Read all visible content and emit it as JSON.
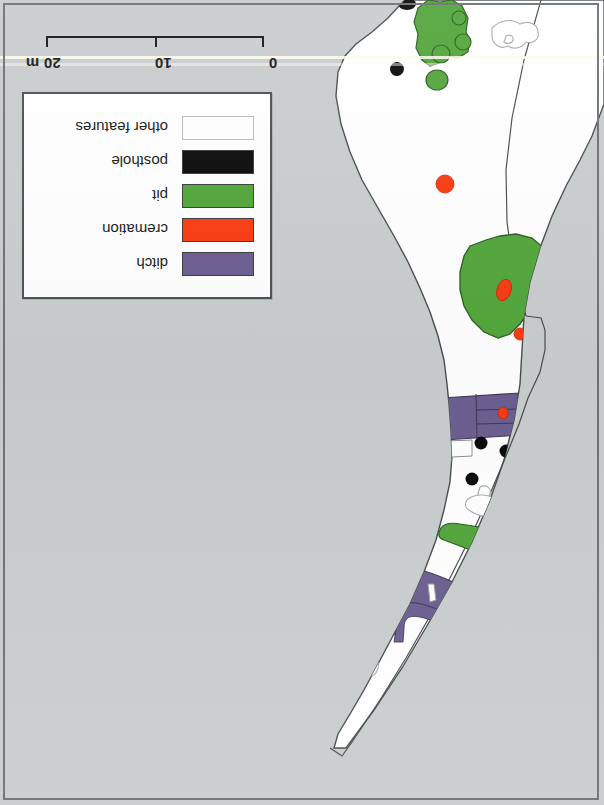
{
  "figure": {
    "kind": "archaeological-excavation-plan",
    "orientation": "rotated-180",
    "background_color": "#c9cdce",
    "trench_fill": "#ffffff",
    "outline_color": "#4a4d4f"
  },
  "scalebar": {
    "labels": [
      "0",
      "10",
      "20"
    ],
    "unit": "m",
    "label_0": "0",
    "label_10": "10",
    "label_20": "20",
    "unit_label": "m",
    "max_value": 20
  },
  "legend": {
    "items": [
      {
        "label": "ditch",
        "color": "#6b5f91",
        "key": "ditch"
      },
      {
        "label": "cremation",
        "color": "#fa3b12",
        "key": "cremation"
      },
      {
        "label": "pit",
        "color": "#52a63b",
        "key": "pit"
      },
      {
        "label": "posthole",
        "color": "#0a0a0a",
        "key": "posthole"
      },
      {
        "label": "other features",
        "color": "#ffffff",
        "key": "other-features"
      }
    ]
  },
  "colors": {
    "ditch": "#6b5f91",
    "cremation": "#fa3b12",
    "pit": "#52a63b",
    "posthole": "#0a0a0a",
    "other_features": "#ffffff",
    "background": "#c9cdce",
    "frame": "#6d7375"
  },
  "map_features": {
    "pits": [
      {
        "id": "pit-north-large",
        "cx": 443,
        "cy": 30
      },
      {
        "id": "pit-north-small",
        "cx": 436,
        "cy": 79
      },
      {
        "id": "pit-central-large",
        "cx": 505,
        "cy": 280
      },
      {
        "id": "pit-elongated",
        "cx": 463,
        "cy": 533
      },
      {
        "id": "pit-ditch-edge-upper",
        "cx": 398,
        "cy": 594
      },
      {
        "id": "pit-ditch-edge-lower",
        "cx": 398,
        "cy": 611
      }
    ],
    "postholes": [
      {
        "id": "posthole-top-edge",
        "cx": 406,
        "cy": 5
      },
      {
        "id": "posthole-upper-left",
        "cx": 361,
        "cy": 25
      },
      {
        "id": "posthole-mid-left",
        "cx": 397,
        "cy": 68
      },
      {
        "id": "posthole-ditch-a",
        "cx": 481,
        "cy": 443
      },
      {
        "id": "posthole-ditch-b",
        "cx": 506,
        "cy": 450
      },
      {
        "id": "posthole-mid",
        "cx": 472,
        "cy": 478
      },
      {
        "id": "posthole-inside-pit",
        "cx": 471,
        "cy": 533
      },
      {
        "id": "posthole-lower",
        "cx": 445,
        "cy": 625
      }
    ],
    "cremations": [
      {
        "id": "cremation-north",
        "cx": 445,
        "cy": 183
      },
      {
        "id": "cremation-in-pit",
        "cx": 504,
        "cy": 290
      },
      {
        "id": "cremation-pit-edge",
        "cx": 520,
        "cy": 334
      },
      {
        "id": "cremation-on-ditch",
        "cx": 503,
        "cy": 413
      }
    ],
    "ditches": [
      {
        "id": "ditch-upper",
        "orientation": "transverse"
      },
      {
        "id": "ditch-lower",
        "orientation": "transverse-curved"
      }
    ]
  }
}
